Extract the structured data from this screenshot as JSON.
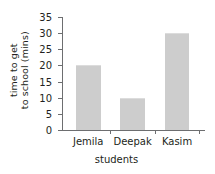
{
  "chart_data": {
    "type": "bar",
    "title": "",
    "categories": [
      "Jemila",
      "Deepak",
      "Kasim"
    ],
    "values": [
      20,
      10,
      30
    ],
    "xlabel": "students",
    "ylabel_lines": [
      "time to get",
      "to school (mins)"
    ],
    "ylabel": "time to get to school (mins)",
    "ylim": [
      0,
      35
    ],
    "ytick_values": [
      0,
      5,
      10,
      15,
      20,
      25,
      30,
      35
    ],
    "ytick_labels": [
      "0",
      "5",
      "10",
      "15",
      "20",
      "25",
      "30",
      "35"
    ],
    "grid": false,
    "legend": null,
    "bar_color": "#cdcdcd",
    "axis_color": "#6d6e70",
    "text_color": "#231f20",
    "background": "#ffffff"
  }
}
